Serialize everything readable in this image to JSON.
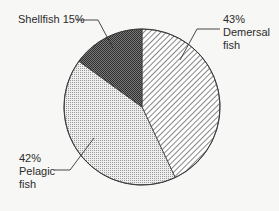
{
  "chart_data": {
    "type": "pie",
    "title": "",
    "start_angle_deg": 0,
    "direction": "clockwise",
    "slices": [
      {
        "name": "Demersal fish",
        "value": 43,
        "label_pct": "43%",
        "label_lines": [
          "Demersal",
          "fish"
        ],
        "pattern": "diagonal-hatch",
        "fill": "#ffffff",
        "ink": "#3a3a3a"
      },
      {
        "name": "Pelagic fish",
        "value": 42,
        "label_pct": "42%",
        "label_lines": [
          "Pelagic",
          "fish"
        ],
        "pattern": "light-dots",
        "fill": "#e6e6e6",
        "ink": "#8a8a8a"
      },
      {
        "name": "Shellfish",
        "value": 15,
        "label_pct": "15%",
        "label_lines": [
          "Shellfish"
        ],
        "pattern": "dark-crosshatch",
        "fill": "#5a5a5a",
        "ink": "#2a2a2a"
      }
    ],
    "categories": [
      "Demersal fish",
      "Pelagic fish",
      "Shellfish"
    ],
    "values": [
      43,
      42,
      15
    ],
    "legend": "none (direct labels with leader lines)"
  },
  "labels": {
    "shellfish": "Shellfish 15%",
    "demersal_pct": "43%",
    "demersal_line1": "Demersal",
    "demersal_line2": "fish",
    "pelagic_pct": "42%",
    "pelagic_line1": "Pelagic",
    "pelagic_line2": "fish"
  },
  "colors": {
    "background": "#f7f7f5",
    "outline": "#3a3a3a",
    "text": "#2b2b2b"
  }
}
